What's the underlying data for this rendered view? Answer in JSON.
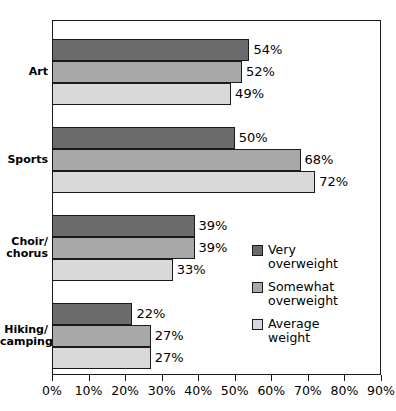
{
  "chart_data": {
    "type": "bar",
    "orientation": "horizontal",
    "title": "",
    "xlabel": "",
    "ylabel": "",
    "xlim": [
      0,
      90
    ],
    "xticks": [
      "0%",
      "10%",
      "20%",
      "30%",
      "40%",
      "50%",
      "60%",
      "70%",
      "80%",
      "90%"
    ],
    "xtick_values": [
      0,
      10,
      20,
      30,
      40,
      50,
      60,
      70,
      80,
      90
    ],
    "grid": false,
    "legend_position": "middle-right-inside",
    "categories": [
      "Art",
      "Sports",
      "Choir/ chorus",
      "Hiking/ camping"
    ],
    "category_lines": [
      [
        "Art"
      ],
      [
        "Sports"
      ],
      [
        "Choir/",
        "chorus"
      ],
      [
        "Hiking/",
        "camping"
      ]
    ],
    "series": [
      {
        "name": "Very overweight",
        "name_lines": [
          "Very",
          "overweight"
        ],
        "color": "#6b6b6b",
        "values": [
          54,
          50,
          39,
          22
        ],
        "labels": [
          "54%",
          "50%",
          "39%",
          "22%"
        ]
      },
      {
        "name": "Somewhat overweight",
        "name_lines": [
          "Somewhat",
          "overweight"
        ],
        "color": "#a8a8a8",
        "values": [
          52,
          68,
          39,
          27
        ],
        "labels": [
          "52%",
          "68%",
          "39%",
          "27%"
        ]
      },
      {
        "name": "Average weight",
        "name_lines": [
          "Average",
          "weight"
        ],
        "color": "#d9d9d9",
        "values": [
          49,
          72,
          33,
          27
        ],
        "labels": [
          "49%",
          "72%",
          "33%",
          "27%"
        ]
      }
    ]
  },
  "colors": {
    "very_overweight": "#6b6b6b",
    "somewhat_overweight": "#a8a8a8",
    "average_weight": "#d9d9d9",
    "axis": "#1a1a1a",
    "background": "#ffffff"
  }
}
